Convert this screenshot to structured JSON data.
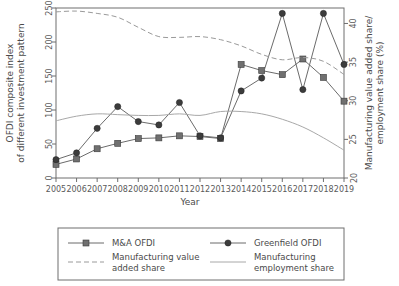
{
  "chart_data": {
    "type": "line",
    "title": "",
    "xlabel": "Year",
    "ylabel": "OFDI composite index of different investment pattern",
    "y2label": "Manufacturing value added share/ employment share (%)",
    "x": [
      2005,
      2006,
      2007,
      2008,
      2009,
      2010,
      2011,
      2012,
      2013,
      2014,
      2015,
      2016,
      2017,
      2018,
      2019
    ],
    "categories": [
      "2005",
      "2006",
      "2007",
      "2008",
      "2009",
      "2010",
      "2011",
      "2012",
      "2013",
      "2014",
      "2015",
      "2016",
      "2017",
      "2018",
      "2019"
    ],
    "ylim": [
      0,
      250
    ],
    "yticks": [
      0,
      50,
      100,
      150,
      200,
      250
    ],
    "y2lim": [
      20,
      42
    ],
    "y2ticks": [
      20,
      25,
      30,
      35,
      40
    ],
    "grid": false,
    "legend_position": "bottom",
    "series": [
      {
        "name": "M&A OFDI",
        "axis": "left",
        "style": "solid-square",
        "marker": "square",
        "color": "#707070",
        "values": [
          20,
          28,
          43,
          51,
          58,
          59,
          62,
          61,
          58,
          167,
          158,
          152,
          175,
          148,
          113
        ]
      },
      {
        "name": "Greenfield OFDI",
        "axis": "left",
        "style": "solid-circle",
        "marker": "circle",
        "color": "#3c3c3c",
        "values": [
          27,
          37,
          73,
          105,
          83,
          78,
          111,
          62,
          59,
          128,
          147,
          242,
          130,
          242,
          167
        ]
      },
      {
        "name": "Manufacturing value added share",
        "axis": "right",
        "style": "dashed",
        "marker": "none",
        "color": "#9a9a9a",
        "values": [
          41.5,
          41.6,
          41.3,
          40.8,
          39.5,
          38.3,
          38.2,
          38.3,
          37.9,
          37.1,
          36.0,
          35.3,
          35.6,
          35.1,
          33.4
        ]
      },
      {
        "name": "Manufacturing employment share",
        "axis": "right",
        "style": "thin-solid",
        "marker": "none",
        "color": "#a8a8a8",
        "values": [
          27.4,
          28.0,
          28.3,
          28.2,
          28.1,
          28.1,
          28.3,
          28.1,
          28.6,
          28.6,
          28.3,
          27.6,
          26.6,
          25.2,
          23.6
        ]
      }
    ]
  },
  "legend": {
    "items": [
      {
        "label": "M&A OFDI",
        "key": "ma-ofdi",
        "style": "solid-square"
      },
      {
        "label": "Greenfield OFDI",
        "key": "greenfield-ofdi",
        "style": "solid-circle"
      },
      {
        "label": "Manufacturing value added share",
        "key": "mfg-value-added-share",
        "style": "dashed"
      },
      {
        "label": "Manufacturing employment share",
        "key": "mfg-employment-share",
        "style": "thin-solid"
      }
    ]
  }
}
